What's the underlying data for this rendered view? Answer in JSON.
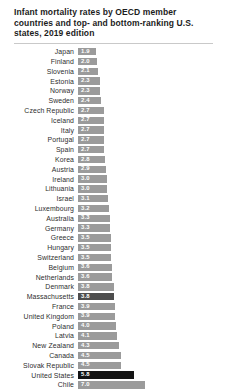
{
  "header": {
    "title": "Infant mortality rates by OECD member countries and top- and bottom-ranking U.S. states, 2019 edition"
  },
  "colors": {
    "bar_default": "#9b9b9b",
    "bar_state_highlight": "#4d4d4d",
    "bar_country_highlight": "#141414",
    "bar_value_text": "#ffffff",
    "title_text": "#1c1c1c",
    "label_text": "#2e2e2e",
    "divider": "#c9c9c9",
    "background": "#ffffff"
  },
  "chart_data": {
    "type": "bar",
    "orientation": "horizontal",
    "title": "Infant mortality rates by OECD member countries and top- and bottom-ranking U.S. states, 2019 edition",
    "xlabel": "",
    "ylabel": "",
    "xlim": [
      0,
      7.0
    ],
    "grid": false,
    "legend": false,
    "value_labels": "inside-bar-left",
    "categories": [
      "Japan",
      "Finland",
      "Slovenia",
      "Estonia",
      "Norway",
      "Sweden",
      "Czech Republic",
      "Iceland",
      "Italy",
      "Portugal",
      "Spain",
      "Korea",
      "Austria",
      "Ireland",
      "Lithuania",
      "Israel",
      "Luxembourg",
      "Australia",
      "Germany",
      "Greece",
      "Hungary",
      "Switzerland",
      "Belgium",
      "Netherlands",
      "Denmark",
      "Massachusetts",
      "France",
      "United Kingdom",
      "Poland",
      "Latvia",
      "New Zealand",
      "Canada",
      "Slovak Republic",
      "United States",
      "Chile"
    ],
    "values": [
      1.9,
      2.0,
      2.1,
      2.3,
      2.3,
      2.4,
      2.7,
      2.7,
      2.7,
      2.7,
      2.7,
      2.8,
      2.9,
      3.0,
      3.0,
      3.1,
      3.2,
      3.3,
      3.3,
      3.5,
      3.5,
      3.5,
      3.6,
      3.6,
      3.8,
      3.8,
      3.9,
      3.9,
      4.0,
      4.1,
      4.3,
      4.5,
      4.5,
      5.8,
      7.0
    ],
    "styles": [
      "default",
      "default",
      "default",
      "default",
      "default",
      "default",
      "default",
      "default",
      "default",
      "default",
      "default",
      "default",
      "default",
      "default",
      "default",
      "default",
      "default",
      "default",
      "default",
      "default",
      "default",
      "default",
      "default",
      "default",
      "default",
      "state",
      "default",
      "default",
      "default",
      "default",
      "default",
      "default",
      "default",
      "country",
      "default"
    ]
  }
}
